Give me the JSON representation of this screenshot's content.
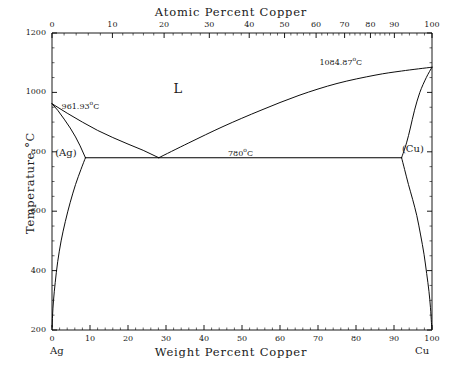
{
  "chart_data": {
    "type": "line",
    "top_axis_label": "Atomic Percent Copper",
    "bottom_axis_label": "Weight Percent Copper",
    "ylabel": "Temperature °C",
    "xlim": [
      0,
      100
    ],
    "ylim": [
      200,
      1200
    ],
    "grid": false,
    "legend": "none",
    "left_endpoint_label": "Ag",
    "right_endpoint_label": "Cu",
    "bottom_ticks": [
      0,
      10,
      20,
      30,
      40,
      50,
      60,
      70,
      80,
      90,
      100
    ],
    "bottom_tick_labels": [
      "0",
      "10",
      "20",
      "30",
      "40",
      "50",
      "60",
      "70",
      "80",
      "90",
      "100"
    ],
    "y_ticks": [
      200,
      400,
      600,
      800,
      1000,
      1200
    ],
    "y_tick_labels": [
      "200",
      "400",
      "600",
      "800",
      "1000",
      "1200"
    ],
    "top_ticks_atomic": [
      0,
      10,
      20,
      30,
      40,
      50,
      60,
      70,
      80,
      90,
      100
    ],
    "top_tick_labels": [
      "0",
      "10",
      "20",
      "30",
      "40",
      "50",
      "60",
      "70",
      "80",
      "90",
      "100"
    ],
    "top_ticks_weight_position": [
      0,
      15.9,
      29.5,
      41.4,
      51.9,
      61.2,
      69.5,
      77.0,
      83.8,
      90.1,
      100
    ],
    "annotations": [
      {
        "name": "ag-melting-point",
        "text": "961.93°C",
        "x_weight": 2.0,
        "temperature": 961.93
      },
      {
        "name": "cu-melting-point",
        "text": "1084.87°C",
        "x_weight": 83.0,
        "temperature": 1084.87
      },
      {
        "name": "eutectic-temperature",
        "text": "780°C",
        "x_weight": 50.0,
        "temperature": 780
      },
      {
        "name": "liquid-region",
        "text": "L",
        "x_weight": 33.0,
        "temperature": 1010
      },
      {
        "name": "ag-solid-solution",
        "text": "(Ag)",
        "x_weight": 4.0,
        "temperature": 795
      },
      {
        "name": "cu-solid-solution",
        "text": "(Cu)",
        "x_weight": 95.5,
        "temperature": 810
      }
    ],
    "series": [
      {
        "name": "ag-liquidus",
        "points": [
          [
            0,
            961.93
          ],
          [
            4,
            930
          ],
          [
            8,
            900
          ],
          [
            12,
            872
          ],
          [
            16,
            848
          ],
          [
            20,
            826
          ],
          [
            24,
            805
          ],
          [
            28.1,
            780
          ]
        ]
      },
      {
        "name": "ag-solidus",
        "points": [
          [
            0,
            961.93
          ],
          [
            1.5,
            940
          ],
          [
            3.2,
            910
          ],
          [
            4.8,
            880
          ],
          [
            6.2,
            850
          ],
          [
            7.4,
            820
          ],
          [
            8.8,
            780
          ]
        ]
      },
      {
        "name": "cu-liquidus",
        "points": [
          [
            28.1,
            780
          ],
          [
            36,
            830
          ],
          [
            45,
            885
          ],
          [
            55,
            940
          ],
          [
            65,
            990
          ],
          [
            75,
            1030
          ],
          [
            85,
            1058
          ],
          [
            92,
            1072
          ],
          [
            100,
            1084.87
          ]
        ]
      },
      {
        "name": "cu-solidus",
        "points": [
          [
            100,
            1084.87
          ],
          [
            98.5,
            1050
          ],
          [
            96.8,
            1000
          ],
          [
            95.4,
            940
          ],
          [
            94.3,
            880
          ],
          [
            93.3,
            830
          ],
          [
            92.0,
            780
          ]
        ]
      },
      {
        "name": "eutectic-horizontal",
        "points": [
          [
            8.8,
            780
          ],
          [
            92.0,
            780
          ]
        ]
      },
      {
        "name": "ag-solvus",
        "points": [
          [
            8.8,
            780
          ],
          [
            7.6,
            740
          ],
          [
            6.2,
            690
          ],
          [
            4.8,
            630
          ],
          [
            3.5,
            565
          ],
          [
            2.4,
            500
          ],
          [
            1.5,
            430
          ],
          [
            0.85,
            360
          ],
          [
            0.4,
            300
          ],
          [
            0.15,
            250
          ],
          [
            0.05,
            210
          ]
        ]
      },
      {
        "name": "cu-solvus",
        "points": [
          [
            92.0,
            780
          ],
          [
            92.8,
            740
          ],
          [
            93.8,
            690
          ],
          [
            94.9,
            640
          ],
          [
            96.0,
            585
          ],
          [
            97.0,
            520
          ],
          [
            97.9,
            455
          ],
          [
            98.6,
            390
          ],
          [
            99.2,
            330
          ],
          [
            99.6,
            275
          ],
          [
            99.85,
            225
          ],
          [
            99.95,
            205
          ]
        ]
      }
    ]
  }
}
